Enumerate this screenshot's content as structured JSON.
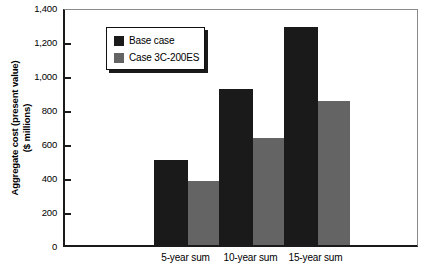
{
  "chart_data": {
    "type": "bar",
    "title": "",
    "xlabel": "",
    "ylabel": "Aggregate cost (present value)\n($ millions)",
    "categories": [
      "5-year sum",
      "10-year sum",
      "15-year sum"
    ],
    "series": [
      {
        "name": "Base case",
        "color": "#1a1a1a",
        "values": [
          500,
          920,
          1280
        ]
      },
      {
        "name": "Case 3C-200ES",
        "color": "#646464",
        "values": [
          375,
          630,
          850
        ]
      }
    ],
    "ylim": [
      0,
      1400
    ],
    "ytick_values": [
      0,
      200,
      400,
      600,
      800,
      1000,
      1200,
      1400
    ],
    "ytick_labels": [
      "0",
      "200",
      "400",
      "600",
      "800",
      "1,000",
      "1,200",
      "1,400"
    ],
    "grid": false,
    "legend_position": "top-left-inside"
  },
  "legend": {
    "entries": [
      {
        "label": "Base case",
        "swatch": "#1a1a1a"
      },
      {
        "label": "Case 3C-200ES",
        "swatch": "#646464"
      }
    ]
  }
}
